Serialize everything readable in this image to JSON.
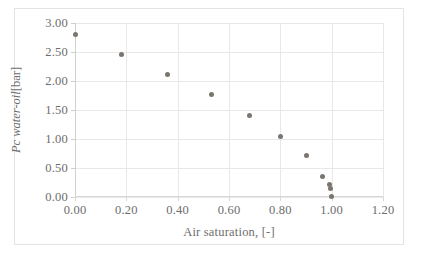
{
  "chart_data": {
    "type": "scatter",
    "title": "",
    "xlabel": "Air saturation,  [-]",
    "ylabel_variable": "Pc water-oil",
    "ylabel_unit": "[bar]",
    "ylabel": "Pc water-oil [bar]",
    "xlim": [
      0.0,
      1.2
    ],
    "ylim": [
      0.0,
      3.0
    ],
    "xticks": [
      "0.00",
      "0.20",
      "0.40",
      "0.60",
      "0.80",
      "1.00",
      "1.20"
    ],
    "xtick_values": [
      0.0,
      0.2,
      0.4,
      0.6,
      0.8,
      1.0,
      1.2
    ],
    "yticks": [
      "0.00",
      "0.50",
      "1.00",
      "1.50",
      "2.00",
      "2.50",
      "3.00"
    ],
    "ytick_values": [
      0.0,
      0.5,
      1.0,
      1.5,
      2.0,
      2.5,
      3.0
    ],
    "grid": true,
    "legend": false,
    "marker_color": "#7b7570",
    "series": [
      {
        "name": "Pc water-oil",
        "x": [
          0.0,
          0.18,
          0.36,
          0.53,
          0.68,
          0.8,
          0.9,
          0.965,
          0.99,
          0.995,
          1.0
        ],
        "y": [
          2.8,
          2.46,
          2.11,
          1.76,
          1.4,
          1.05,
          0.72,
          0.36,
          0.21,
          0.15,
          0.01
        ]
      }
    ]
  },
  "figure": {
    "background_color": "#ffffff",
    "border_color": "#e3e3e3",
    "gridline_color": "#e8e8e8",
    "text_color": "#6d6d6d"
  }
}
